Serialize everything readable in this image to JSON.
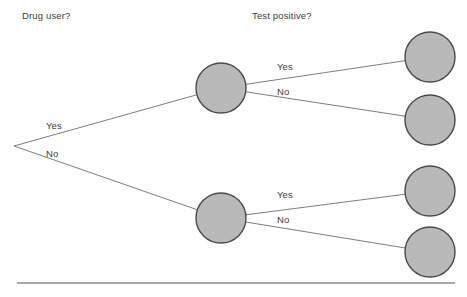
{
  "figure": {
    "type": "probability-tree-diagram",
    "background_color": "#ffffff",
    "node_fill_color": "#b9b9b9",
    "node_stroke_color": "#4a4a4a",
    "edge_color": "#6e6e6e",
    "text_color": "#3d3d3d",
    "rule_color": "#8a8a8a"
  },
  "headings": [
    {
      "id": "heading-drug-user",
      "label": "Drug user?",
      "x": 22,
      "y": 10
    },
    {
      "id": "heading-test-positive",
      "label": "Test positive?",
      "x": 252,
      "y": 10
    }
  ],
  "root": {
    "id": "root",
    "x": 14,
    "y": 146
  },
  "nodes": [
    {
      "id": "node-drug-yes",
      "level": 1,
      "x": 221,
      "y": 88,
      "r": 25,
      "branch": "Yes"
    },
    {
      "id": "node-drug-no",
      "level": 1,
      "x": 221,
      "y": 218,
      "r": 25,
      "branch": "No"
    },
    {
      "id": "node-yes-positive",
      "level": 2,
      "x": 430,
      "y": 57,
      "r": 25,
      "branch": "Yes"
    },
    {
      "id": "node-yes-negative",
      "level": 2,
      "x": 430,
      "y": 120,
      "r": 25,
      "branch": "No"
    },
    {
      "id": "node-no-positive",
      "level": 2,
      "x": 430,
      "y": 191,
      "r": 25,
      "branch": "Yes"
    },
    {
      "id": "node-no-negative",
      "level": 2,
      "x": 430,
      "y": 252,
      "r": 25,
      "branch": "No"
    }
  ],
  "edges": [
    {
      "id": "edge-root-yes",
      "from": "root",
      "to": "node-drug-yes"
    },
    {
      "id": "edge-root-no",
      "from": "root",
      "to": "node-drug-no"
    },
    {
      "id": "edge-yes-positive",
      "from": "node-drug-yes",
      "to": "node-yes-positive"
    },
    {
      "id": "edge-yes-negative",
      "from": "node-drug-yes",
      "to": "node-yes-negative"
    },
    {
      "id": "edge-no-positive",
      "from": "node-drug-no",
      "to": "node-no-positive"
    },
    {
      "id": "edge-no-negative",
      "from": "node-drug-no",
      "to": "node-no-negative"
    }
  ],
  "edge_labels": [
    {
      "id": "label-root-yes",
      "label": "Yes",
      "x": 46,
      "y": 120
    },
    {
      "id": "label-root-no",
      "label": "No",
      "x": 46,
      "y": 148
    },
    {
      "id": "label-yes-positive",
      "label": "Yes",
      "x": 277,
      "y": 61
    },
    {
      "id": "label-yes-negative",
      "label": "No",
      "x": 277,
      "y": 86
    },
    {
      "id": "label-no-positive",
      "label": "Yes",
      "x": 277,
      "y": 189
    },
    {
      "id": "label-no-negative",
      "label": "No",
      "x": 277,
      "y": 214
    }
  ],
  "rule": {
    "id": "bottom-rule",
    "x1": 17,
    "y1": 283,
    "x2": 455,
    "y2": 283
  },
  "chart_data": {
    "type": "diagram",
    "levels": [
      "Drug user?",
      "Test positive?"
    ],
    "branches": [
      "Yes",
      "No"
    ],
    "leaf_count": 4,
    "paths": [
      [
        "Yes",
        "Yes"
      ],
      [
        "Yes",
        "No"
      ],
      [
        "No",
        "Yes"
      ],
      [
        "No",
        "No"
      ]
    ]
  }
}
